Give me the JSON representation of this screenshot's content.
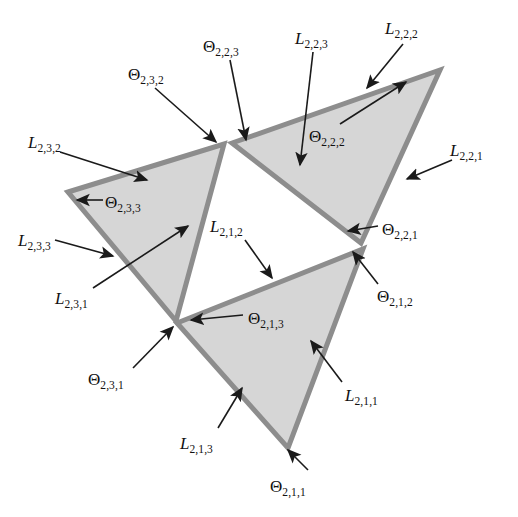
{
  "figure": {
    "background_color": "#ffffff",
    "fill_color": "#d6d6d6",
    "edge_color": "#8d8d8d",
    "label_color": "#111111",
    "arrow_color": "#1a1a1a"
  },
  "shapes": {
    "triangle_left": {
      "name": "L_2,3 sub-triangle",
      "points": "68,192 224,144 176,321",
      "fill": "#d6d6d6"
    },
    "triangle_right": {
      "name": "L_2,2 sub-triangle",
      "points": "232,143 440,70 361,243",
      "fill": "#d6d6d6"
    },
    "triangle_bottom": {
      "name": "L_2,1 sub-triangle",
      "points": "177,323 363,249 288,448",
      "fill": "#d6d6d6"
    }
  },
  "labels": [
    {
      "id": "L_2_3_2",
      "kind": "L",
      "base": "L",
      "sub": "2,3,2",
      "x": 28,
      "y": 134
    },
    {
      "id": "Th_2_3_2",
      "kind": "Theta",
      "base": "Θ",
      "sub": "2,3,2",
      "x": 128,
      "y": 66
    },
    {
      "id": "Th_2_2_3",
      "kind": "Theta",
      "base": "Θ",
      "sub": "2,2,3",
      "x": 203,
      "y": 38
    },
    {
      "id": "L_2_2_3",
      "kind": "L",
      "base": "L",
      "sub": "2,2,3",
      "x": 295,
      "y": 30
    },
    {
      "id": "L_2_2_2",
      "kind": "L",
      "base": "L",
      "sub": "2,2,2",
      "x": 385,
      "y": 20
    },
    {
      "id": "L_2_2_1",
      "kind": "L",
      "base": "L",
      "sub": "2,2,1",
      "x": 450,
      "y": 142
    },
    {
      "id": "Th_2_2_2",
      "kind": "Theta",
      "base": "Θ",
      "sub": "2,2,2",
      "x": 309,
      "y": 128
    },
    {
      "id": "Th_2_3_3",
      "kind": "Theta",
      "base": "Θ",
      "sub": "2,3,3",
      "x": 105,
      "y": 194
    },
    {
      "id": "Th_2_2_1",
      "kind": "Theta",
      "base": "Θ",
      "sub": "2,2,1",
      "x": 382,
      "y": 221
    },
    {
      "id": "L_2_3_3",
      "kind": "L",
      "base": "L",
      "sub": "2,3,3",
      "x": 18,
      "y": 232
    },
    {
      "id": "L_2_1_2",
      "kind": "L",
      "base": "L",
      "sub": "2,1,2",
      "x": 210,
      "y": 218
    },
    {
      "id": "L_2_3_1",
      "kind": "L",
      "base": "L",
      "sub": "2,3,1",
      "x": 55,
      "y": 290
    },
    {
      "id": "Th_2_1_2",
      "kind": "Theta",
      "base": "Θ",
      "sub": "2,1,2",
      "x": 377,
      "y": 288
    },
    {
      "id": "Th_2_1_3",
      "kind": "Theta",
      "base": "Θ",
      "sub": "2,1,3",
      "x": 248,
      "y": 310
    },
    {
      "id": "Th_2_3_1",
      "kind": "Theta",
      "base": "Θ",
      "sub": "2,3,1",
      "x": 88,
      "y": 371
    },
    {
      "id": "L_2_1_1",
      "kind": "L",
      "base": "L",
      "sub": "2,1,1",
      "x": 345,
      "y": 387
    },
    {
      "id": "L_2_1_3",
      "kind": "L",
      "base": "L",
      "sub": "2,1,3",
      "x": 180,
      "y": 435
    },
    {
      "id": "Th_2_1_1",
      "kind": "Theta",
      "base": "Θ",
      "sub": "2,1,1",
      "x": 270,
      "y": 478
    }
  ],
  "arrows": [
    {
      "id": "arrow_L_2_3_2",
      "x1": 60,
      "y1": 152,
      "x2": 147,
      "y2": 180
    },
    {
      "id": "arrow_Th_2_3_2",
      "x1": 155,
      "y1": 88,
      "x2": 216,
      "y2": 142
    },
    {
      "id": "arrow_Th_2_2_3",
      "x1": 230,
      "y1": 60,
      "x2": 246,
      "y2": 140
    },
    {
      "id": "arrow_L_2_2_3",
      "x1": 313,
      "y1": 52,
      "x2": 300,
      "y2": 165
    },
    {
      "id": "arrow_L_2_2_2",
      "x1": 403,
      "y1": 44,
      "x2": 367,
      "y2": 88
    },
    {
      "id": "arrow_L_2_2_1",
      "x1": 452,
      "y1": 160,
      "x2": 407,
      "y2": 179
    },
    {
      "id": "arrow_Th_2_2_2",
      "x1": 340,
      "y1": 124,
      "x2": 406,
      "y2": 82
    },
    {
      "id": "arrow_Th_2_3_3",
      "x1": 103,
      "y1": 200,
      "x2": 77,
      "y2": 200
    },
    {
      "id": "arrow_Th_2_2_1",
      "x1": 378,
      "y1": 226,
      "x2": 348,
      "y2": 231
    },
    {
      "id": "arrow_L_2_3_3",
      "x1": 55,
      "y1": 240,
      "x2": 113,
      "y2": 256
    },
    {
      "id": "arrow_L_2_1_2",
      "x1": 245,
      "y1": 240,
      "x2": 272,
      "y2": 278
    },
    {
      "id": "arrow_L_2_3_1",
      "x1": 93,
      "y1": 288,
      "x2": 188,
      "y2": 226
    },
    {
      "id": "arrow_Th_2_1_2",
      "x1": 378,
      "y1": 284,
      "x2": 353,
      "y2": 252
    },
    {
      "id": "arrow_Th_2_1_3",
      "x1": 243,
      "y1": 315,
      "x2": 191,
      "y2": 320
    },
    {
      "id": "arrow_Th_2_3_1",
      "x1": 133,
      "y1": 368,
      "x2": 173,
      "y2": 327
    },
    {
      "id": "arrow_L_2_1_1",
      "x1": 342,
      "y1": 382,
      "x2": 311,
      "y2": 341
    },
    {
      "id": "arrow_L_2_1_3",
      "x1": 218,
      "y1": 428,
      "x2": 242,
      "y2": 388
    },
    {
      "id": "arrow_Th_2_1_1",
      "x1": 308,
      "y1": 470,
      "x2": 288,
      "y2": 450
    }
  ]
}
